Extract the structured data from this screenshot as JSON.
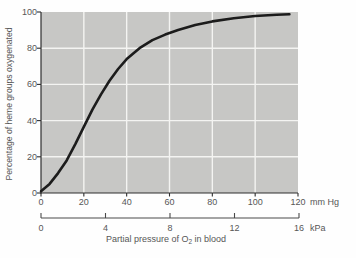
{
  "chart_data": {
    "type": "line",
    "title": "",
    "ylabel": "Percentage of heme groups oxygenated",
    "xlabel": "Partial pressure of O2 in blood",
    "xlabel_parts": {
      "pre": "Partial pressure of O",
      "sub": "2",
      "post": " in blood"
    },
    "x_axis_mmhg": {
      "unit": "mm Hg",
      "ticks": [
        0,
        20,
        40,
        60,
        80,
        100,
        120
      ],
      "range": [
        0,
        120
      ]
    },
    "x_axis_kpa": {
      "unit": "kPa",
      "ticks": [
        0,
        4,
        8,
        12,
        16
      ],
      "range": [
        0,
        16
      ]
    },
    "y_axis": {
      "ticks": [
        0,
        20,
        40,
        60,
        80,
        100
      ],
      "range": [
        0,
        100
      ]
    },
    "grid": true,
    "legend": "none",
    "series": [
      {
        "name": "oxygen-hemoglobin dissociation curve",
        "x_mmhg": [
          0,
          4,
          8,
          12,
          16,
          20,
          24,
          28,
          32,
          36,
          40,
          46,
          52,
          58,
          64,
          72,
          80,
          90,
          100,
          110,
          116
        ],
        "y_percent": [
          1,
          5,
          11,
          18,
          27,
          36.5,
          46,
          54.5,
          62,
          68.5,
          74,
          80,
          84.5,
          87.5,
          90,
          92.8,
          94.8,
          96.6,
          97.8,
          98.5,
          98.8
        ]
      }
    ],
    "colors": {
      "page_bg": "#fefefe",
      "plot_bg": "#c7c7c5",
      "grid": "#f4f4f2",
      "curve": "#1c1c1c",
      "axis": "#2e2e2e",
      "scale_line": "#4a4a4a",
      "text": "#565656"
    }
  }
}
